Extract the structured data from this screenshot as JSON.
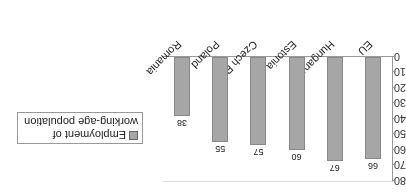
{
  "chart_data": {
    "type": "bar",
    "title": "",
    "xlabel": "",
    "ylabel": "",
    "categories": [
      "EU",
      "Hungary",
      "Estonia",
      "Czech R.",
      "Poland",
      "Romania"
    ],
    "series": [
      {
        "name": "Employment of working-age population",
        "values": [
          66,
          67,
          60,
          57,
          55,
          38
        ],
        "color": "#a6a6a6"
      }
    ],
    "ylim": [
      0,
      80
    ],
    "yticks": [
      0,
      10,
      20,
      30,
      40,
      50,
      60,
      70,
      80
    ],
    "grid": false,
    "legend_position": "right",
    "data_labels": true,
    "rendered_rotation_deg": 180
  },
  "legend": {
    "line1": "Employment of",
    "line2": "working-age population"
  }
}
